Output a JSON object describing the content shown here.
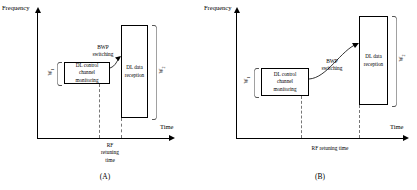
{
  "figure": {
    "axis": {
      "y_label": "Frequency",
      "x_label": "Time"
    },
    "panels": [
      {
        "id": "A",
        "caption": "(A)",
        "control_box": {
          "line1": "DL control",
          "line2": "channel",
          "line3": "monitoring"
        },
        "data_box": {
          "line1": "DL data",
          "line2": "reception"
        },
        "switching_label": {
          "line1": "BWP",
          "line2": "switching"
        },
        "retuning_label": {
          "line1": "RF",
          "line2": "retuning",
          "line3": "time"
        },
        "width_left": "W",
        "width_left_sub": "1",
        "width_right": "W",
        "width_right_sub": "2"
      },
      {
        "id": "B",
        "caption": "(B)",
        "control_box": {
          "line1": "DL control",
          "line2": "channel",
          "line3": "monitoring"
        },
        "data_box": {
          "line1": "DL data",
          "line2": "reception"
        },
        "switching_label": {
          "line1": "BWP",
          "line2": "switching"
        },
        "retuning_label": {
          "line1": "RF retuning time",
          "line2": "",
          "line3": ""
        },
        "width_left": "W",
        "width_left_sub": "1",
        "width_right": "W",
        "width_right_sub": "2"
      }
    ]
  },
  "colors": {
    "line": "#000000",
    "dashed": "#777777",
    "background": "#ffffff"
  }
}
